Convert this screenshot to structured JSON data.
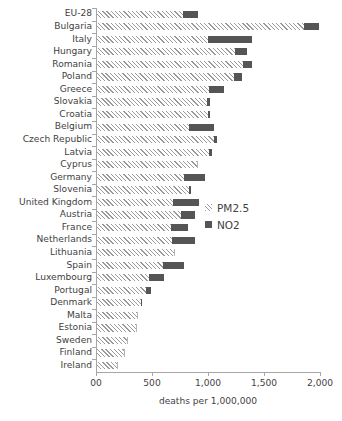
{
  "chart_data": {
    "type": "bar",
    "orientation": "horizontal",
    "stacked": true,
    "title": "",
    "xlabel": "deaths per 1,000,000",
    "ylabel": "",
    "xlim": [
      0,
      2000
    ],
    "xticks": [
      0,
      500,
      1000,
      1500,
      2000
    ],
    "xticklabels": [
      "00",
      "500",
      "1,000",
      "1,500",
      "2,000"
    ],
    "grid": false,
    "legend_position": "center-right",
    "categories": [
      "EU-28",
      "Bulgaria",
      "Italy",
      "Hungary",
      "Romania",
      "Poland",
      "Greece",
      "Slovakia",
      "Croatia",
      "Belgium",
      "Czech Republic",
      "Latvia",
      "Cyprus",
      "Germany",
      "Slovenia",
      "United Kingdom",
      "Austria",
      "France",
      "Netherlands",
      "Lithuania",
      "Spain",
      "Luxembourg",
      "Portugal",
      "Denmark",
      "Malta",
      "Estonia",
      "Sweden",
      "Finland",
      "Ireland"
    ],
    "series": [
      {
        "name": "PM2.5",
        "color": "#9a9a9a",
        "pattern": "diagonal-hatch",
        "values": [
          780,
          1860,
          1000,
          1240,
          1310,
          1230,
          1010,
          990,
          1000,
          830,
          1050,
          1010,
          900,
          790,
          830,
          690,
          760,
          670,
          680,
          700,
          600,
          470,
          450,
          400,
          370,
          360,
          280,
          250,
          190
        ]
      },
      {
        "name": "NO2",
        "color": "#555555",
        "pattern": "solid",
        "values": [
          130,
          130,
          390,
          110,
          80,
          70,
          130,
          30,
          20,
          220,
          30,
          30,
          0,
          180,
          20,
          230,
          120,
          150,
          200,
          0,
          190,
          140,
          40,
          10,
          0,
          0,
          0,
          0,
          0
        ]
      }
    ],
    "totals": [
      910,
      1990,
      1390,
      1350,
      1390,
      1300,
      1140,
      1020,
      1020,
      1050,
      1080,
      1040,
      900,
      970,
      850,
      920,
      880,
      820,
      880,
      700,
      790,
      610,
      490,
      410,
      370,
      360,
      280,
      250,
      190
    ]
  },
  "legend": {
    "items": [
      {
        "label": "PM2.5",
        "swatch": "hatch-swatch"
      },
      {
        "label": "NO2",
        "swatch": "solid-swatch"
      }
    ]
  }
}
